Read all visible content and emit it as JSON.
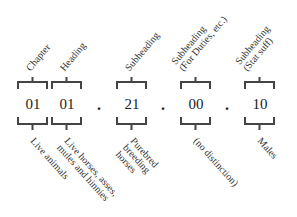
{
  "diagram": {
    "title": "",
    "segments": [
      {
        "id": "chapter",
        "code": "01",
        "top_label": "Chapter",
        "bottom_label": "Live animals"
      },
      {
        "id": "heading",
        "code": "01",
        "top_label": "Heading",
        "bottom_label": "Live horses, asses,\nmules and hinnies"
      },
      {
        "id": "subheading",
        "code": "21",
        "top_label": "Subheading",
        "bottom_label": "Purebred\nbreeding\nhorses"
      },
      {
        "id": "subheading-duties",
        "code": "00",
        "top_label": "Subheading\n(For Duties, etc.)",
        "bottom_label": "(no distinction)"
      },
      {
        "id": "subheading-stat",
        "code": "10",
        "top_label": "Subheading\n(Stat suff)",
        "bottom_label": "Males"
      }
    ],
    "separators": [
      ".",
      ".",
      "."
    ],
    "colors": {
      "bracket": "#444444",
      "text": "#222222"
    }
  }
}
